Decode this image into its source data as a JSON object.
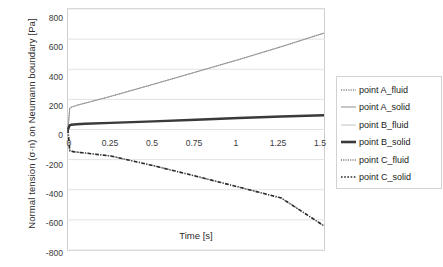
{
  "chart_data": {
    "type": "line",
    "title": "",
    "xlabel": "Time [s]",
    "ylabel": "Normal tension (σ·n) on Neumann boundary [Pa]",
    "xlim": [
      0,
      1.5
    ],
    "ylim": [
      -800,
      800
    ],
    "xticks": [
      "0",
      "0.25",
      "0.5",
      "0.75",
      "1",
      "1.25",
      "1.5"
    ],
    "xtick_values": [
      0,
      0.25,
      0.5,
      0.75,
      1,
      1.25,
      1.5
    ],
    "yticks": [
      "800",
      "600",
      "400",
      "200",
      "0",
      "-200",
      "-400",
      "-600",
      "-800"
    ],
    "ytick_values": [
      800,
      600,
      400,
      200,
      0,
      -200,
      -400,
      -600,
      -800
    ],
    "grid": true,
    "grid_axis": "y",
    "legend_position": "right",
    "x": [
      0,
      0.01,
      0.02,
      0.05,
      0.1,
      0.25,
      0.5,
      0.75,
      1.0,
      1.25,
      1.5
    ],
    "series": [
      {
        "name": "point A_fluid",
        "style": "dotted",
        "color": "#8a8a8a",
        "width": 1.2,
        "values": [
          0,
          140,
          148,
          160,
          175,
          220,
          300,
          382,
          464,
          550,
          640
        ]
      },
      {
        "name": "point A_solid",
        "style": "solid",
        "color": "#9a9a9a",
        "width": 1.0,
        "values": [
          0,
          140,
          148,
          160,
          175,
          220,
          300,
          382,
          464,
          550,
          640
        ]
      },
      {
        "name": "point B_fluid",
        "style": "solid",
        "color": "#b5b5b5",
        "width": 1.0,
        "values": [
          0,
          28,
          32,
          35,
          38,
          44,
          54,
          65,
          76,
          86,
          95
        ]
      },
      {
        "name": "point B_solid",
        "style": "solid-thick",
        "color": "#3a3a3a",
        "width": 2.4,
        "values": [
          0,
          28,
          32,
          35,
          38,
          44,
          54,
          65,
          76,
          86,
          95
        ]
      },
      {
        "name": "point C_fluid",
        "style": "dotted",
        "color": "#6f6f6f",
        "width": 1.3,
        "values": [
          0,
          -140,
          -145,
          -150,
          -156,
          -176,
          -240,
          -310,
          -382,
          -455,
          -640
        ]
      },
      {
        "name": "point C_solid",
        "style": "dash-dot",
        "color": "#2b2b2b",
        "width": 1.6,
        "values": [
          0,
          -140,
          -145,
          -150,
          -156,
          -176,
          -240,
          -310,
          -382,
          -455,
          -640
        ]
      }
    ]
  },
  "legend": {
    "items": [
      {
        "label": "point A_fluid"
      },
      {
        "label": "point A_solid"
      },
      {
        "label": "point B_fluid"
      },
      {
        "label": "point B_solid"
      },
      {
        "label": "point C_fluid"
      },
      {
        "label": "point C_solid"
      }
    ]
  },
  "colors": {
    "background": "#ffffff",
    "grid": "#e2e2e2",
    "frame": "#cfcfcf",
    "text": "#2b2b2b"
  }
}
